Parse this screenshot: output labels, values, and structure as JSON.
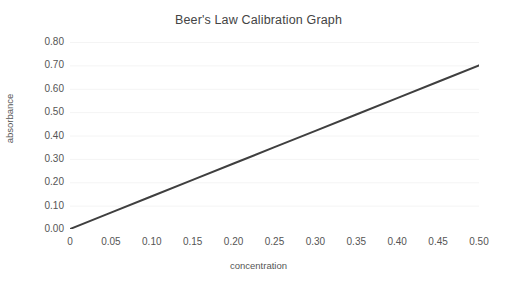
{
  "chart_data": {
    "type": "line",
    "title": "Beer's Law Calibration Graph",
    "xlabel": "concentration",
    "ylabel": "absorbance",
    "xlim": [
      0,
      0.5
    ],
    "ylim": [
      0,
      0.8
    ],
    "grid": true,
    "legend": false,
    "x_tick_labels": [
      "0",
      "0.05",
      "0.10",
      "0.15",
      "0.20",
      "0.25",
      "0.30",
      "0.35",
      "0.40",
      "0.45",
      "0.50"
    ],
    "x_tick_values": [
      0,
      0.05,
      0.1,
      0.15,
      0.2,
      0.25,
      0.3,
      0.35,
      0.4,
      0.45,
      0.5
    ],
    "y_tick_labels": [
      "0.00",
      "0.10",
      "0.20",
      "0.30",
      "0.40",
      "0.50",
      "0.60",
      "0.70",
      "0.80"
    ],
    "y_tick_values": [
      0.0,
      0.1,
      0.2,
      0.3,
      0.4,
      0.5,
      0.6,
      0.7,
      0.8
    ],
    "series": [
      {
        "name": "calibration line",
        "color": "#3f3f3f",
        "line_width": 2,
        "x": [
          0,
          0.05,
          0.1,
          0.15,
          0.2,
          0.25,
          0.3,
          0.35,
          0.4,
          0.45,
          0.5
        ],
        "values": [
          0.0,
          0.07,
          0.14,
          0.21,
          0.28,
          0.35,
          0.42,
          0.49,
          0.56,
          0.63,
          0.7
        ]
      }
    ],
    "slope": 1.4,
    "intercept": 0.0
  },
  "style": {
    "background": "#ffffff",
    "grid_color": "#f4f4f4",
    "axis_text_color": "#555555",
    "title_color": "#444444",
    "line_color": "#3f3f3f"
  }
}
